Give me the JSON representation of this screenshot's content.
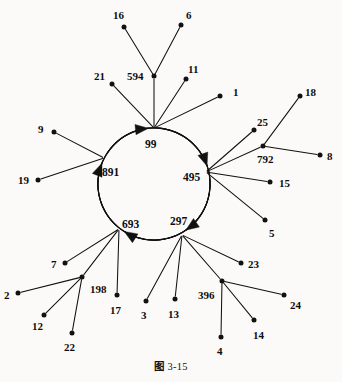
{
  "figure": {
    "caption_prefix": "图",
    "caption_number": "3-15",
    "type": "directed-graph",
    "background_color": "#fbfaf8",
    "stroke_color": "#111111"
  },
  "graph_data": {
    "type": "diagram",
    "description": "Directed graph with a central 5-node cycle and attached in-trees of leaf nodes",
    "cycle": [
      "99",
      "891",
      "693",
      "297",
      "495"
    ],
    "cycle_direction": "99 -> 891 -> 693 -> 297 -> 495 -> 99",
    "circle": {
      "cx": 154,
      "cy": 184,
      "r": 56
    },
    "nodes": [
      {
        "id": "99",
        "label": "99",
        "x": 154,
        "y": 128,
        "kind": "cycle",
        "label_x": 145,
        "label_y": 139
      },
      {
        "id": "891",
        "label": "891",
        "x": 104,
        "y": 158,
        "kind": "cycle",
        "label_x": 102,
        "label_y": 167
      },
      {
        "id": "495",
        "label": "495",
        "x": 206,
        "y": 172,
        "kind": "cycle",
        "label_x": 183,
        "label_y": 172
      },
      {
        "id": "693",
        "label": "693",
        "x": 119,
        "y": 229,
        "kind": "cycle",
        "label_x": 122,
        "label_y": 219
      },
      {
        "id": "297",
        "label": "297",
        "x": 182,
        "y": 235,
        "kind": "cycle",
        "label_x": 170,
        "label_y": 216
      },
      {
        "id": "594",
        "label": "594",
        "x": 154,
        "y": 76,
        "kind": "junction",
        "label_x": 127,
        "label_y": 71
      },
      {
        "id": "792",
        "label": "792",
        "x": 263,
        "y": 146,
        "kind": "junction",
        "label_x": 257,
        "label_y": 154
      },
      {
        "id": "198",
        "label": "198",
        "x": 82,
        "y": 277,
        "kind": "junction",
        "label_x": 90,
        "label_y": 284
      },
      {
        "id": "396",
        "label": "396",
        "x": 222,
        "y": 281,
        "kind": "junction",
        "label_x": 198,
        "label_y": 290
      },
      {
        "id": "16",
        "label": "16",
        "x": 124,
        "y": 27,
        "kind": "leaf",
        "label_x": 113,
        "label_y": 10
      },
      {
        "id": "6",
        "label": "6",
        "x": 181,
        "y": 25,
        "kind": "leaf",
        "label_x": 186,
        "label_y": 10
      },
      {
        "id": "21",
        "label": "21",
        "x": 112,
        "y": 84,
        "kind": "leaf",
        "label_x": 94,
        "label_y": 71
      },
      {
        "id": "11",
        "label": "11",
        "x": 186,
        "y": 79,
        "kind": "leaf",
        "label_x": 188,
        "label_y": 64
      },
      {
        "id": "1",
        "label": "1",
        "x": 220,
        "y": 96,
        "kind": "leaf",
        "label_x": 233,
        "label_y": 87
      },
      {
        "id": "9",
        "label": "9",
        "x": 54,
        "y": 132,
        "kind": "leaf",
        "label_x": 38,
        "label_y": 124
      },
      {
        "id": "19",
        "label": "19",
        "x": 38,
        "y": 180,
        "kind": "leaf",
        "label_x": 18,
        "label_y": 175
      },
      {
        "id": "25",
        "label": "25",
        "x": 254,
        "y": 130,
        "kind": "leaf",
        "label_x": 257,
        "label_y": 117
      },
      {
        "id": "18",
        "label": "18",
        "x": 300,
        "y": 96,
        "kind": "leaf",
        "label_x": 305,
        "label_y": 87
      },
      {
        "id": "8",
        "label": "8",
        "x": 320,
        "y": 155,
        "kind": "leaf",
        "label_x": 327,
        "label_y": 151
      },
      {
        "id": "15",
        "label": "15",
        "x": 270,
        "y": 182,
        "kind": "leaf",
        "label_x": 279,
        "label_y": 178
      },
      {
        "id": "5",
        "label": "5",
        "x": 265,
        "y": 220,
        "kind": "leaf",
        "label_x": 269,
        "label_y": 228
      },
      {
        "id": "7",
        "label": "7",
        "x": 65,
        "y": 263,
        "kind": "leaf",
        "label_x": 51,
        "label_y": 259
      },
      {
        "id": "2",
        "label": "2",
        "x": 18,
        "y": 293,
        "kind": "leaf",
        "label_x": 4,
        "label_y": 290
      },
      {
        "id": "12",
        "label": "12",
        "x": 44,
        "y": 315,
        "kind": "leaf",
        "label_x": 32,
        "label_y": 321
      },
      {
        "id": "22",
        "label": "22",
        "x": 72,
        "y": 333,
        "kind": "leaf",
        "label_x": 64,
        "label_y": 342
      },
      {
        "id": "17",
        "label": "17",
        "x": 117,
        "y": 295,
        "kind": "leaf",
        "label_x": 110,
        "label_y": 305
      },
      {
        "id": "3",
        "label": "3",
        "x": 146,
        "y": 301,
        "kind": "leaf",
        "label_x": 141,
        "label_y": 310
      },
      {
        "id": "13",
        "label": "13",
        "x": 175,
        "y": 299,
        "kind": "leaf",
        "label_x": 168,
        "label_y": 309
      },
      {
        "id": "23",
        "label": "23",
        "x": 241,
        "y": 263,
        "kind": "leaf",
        "label_x": 248,
        "label_y": 259
      },
      {
        "id": "24",
        "label": "24",
        "x": 284,
        "y": 295,
        "kind": "leaf",
        "label_x": 290,
        "label_y": 300
      },
      {
        "id": "14",
        "label": "14",
        "x": 254,
        "y": 320,
        "kind": "leaf",
        "label_x": 253,
        "label_y": 330
      },
      {
        "id": "4",
        "label": "4",
        "x": 221,
        "y": 337,
        "kind": "leaf",
        "label_x": 217,
        "label_y": 346
      }
    ],
    "tree_edges": [
      {
        "from": "16",
        "to": "594"
      },
      {
        "from": "6",
        "to": "594"
      },
      {
        "from": "594",
        "to": "99"
      },
      {
        "from": "21",
        "to": "99"
      },
      {
        "from": "11",
        "to": "99"
      },
      {
        "from": "1",
        "to": "99"
      },
      {
        "from": "9",
        "to": "891"
      },
      {
        "from": "19",
        "to": "891"
      },
      {
        "from": "18",
        "to": "792"
      },
      {
        "from": "8",
        "to": "792"
      },
      {
        "from": "792",
        "to": "495"
      },
      {
        "from": "25",
        "to": "495"
      },
      {
        "from": "15",
        "to": "495"
      },
      {
        "from": "5",
        "to": "495"
      },
      {
        "from": "7",
        "to": "693"
      },
      {
        "from": "2",
        "to": "198"
      },
      {
        "from": "12",
        "to": "198"
      },
      {
        "from": "22",
        "to": "198"
      },
      {
        "from": "198",
        "to": "693"
      },
      {
        "from": "17",
        "to": "693"
      },
      {
        "from": "3",
        "to": "297"
      },
      {
        "from": "13",
        "to": "297"
      },
      {
        "from": "23",
        "to": "297"
      },
      {
        "from": "24",
        "to": "396"
      },
      {
        "from": "14",
        "to": "396"
      },
      {
        "from": "4",
        "to": "396"
      },
      {
        "from": "396",
        "to": "297"
      }
    ]
  }
}
